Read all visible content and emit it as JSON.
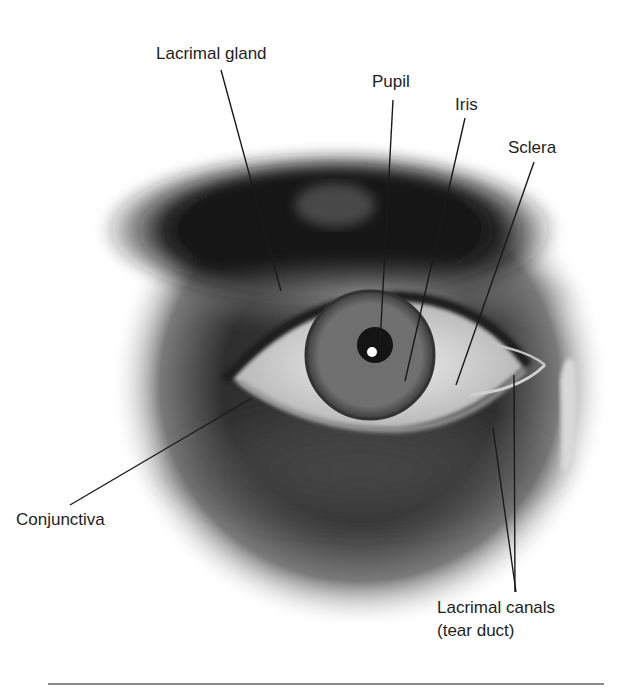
{
  "figure": {
    "labels": [
      {
        "id": "lacrimal-gland",
        "text": "Lacrimal gland"
      },
      {
        "id": "pupil",
        "text": "Pupil"
      },
      {
        "id": "iris",
        "text": "Iris"
      },
      {
        "id": "sclera",
        "text": "Sclera"
      },
      {
        "id": "conjunctiva",
        "text": "Conjunctiva"
      },
      {
        "id": "lacrimal-canals",
        "line1": "Lacrimal canals",
        "line2": "(tear duct)"
      }
    ]
  },
  "colors": {
    "background": "#ffffff",
    "label_text": "#1e1e1e",
    "leader_line": "#1a1a1a",
    "bottom_rule": "#8a8a8a"
  }
}
